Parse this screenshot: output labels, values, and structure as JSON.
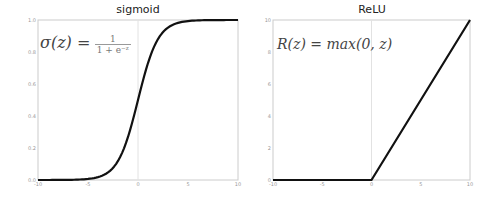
{
  "chart_data": [
    {
      "type": "line",
      "title": "sigmoid",
      "formula": "σ(z) = 1 / (1 + e^-z)",
      "formula_parts": {
        "lhs": "σ(z) =",
        "num": "1",
        "den": "1 + e⁻ᶻ"
      },
      "xlabel": "",
      "ylabel": "",
      "xlim": [
        -10,
        10
      ],
      "ylim": [
        0.0,
        1.0
      ],
      "xticks": [
        "-10",
        "-5",
        "0",
        "5",
        "10"
      ],
      "yticks": [
        "0.0",
        "0.2",
        "0.4",
        "0.6",
        "0.8",
        "1.0"
      ],
      "grid": "x=0 vertical gridline only",
      "x": [
        -10,
        -8,
        -6,
        -5,
        -4,
        -3,
        -2,
        -1,
        0,
        1,
        2,
        3,
        4,
        5,
        6,
        8,
        10
      ],
      "values": [
        0.0,
        0.0003,
        0.0025,
        0.0067,
        0.018,
        0.047,
        0.119,
        0.269,
        0.5,
        0.731,
        0.881,
        0.953,
        0.982,
        0.993,
        0.9975,
        0.9997,
        1.0
      ],
      "line_color": "#111111"
    },
    {
      "type": "line",
      "title": "ReLU",
      "formula": "R(z) = max(0, z)",
      "xlabel": "",
      "ylabel": "",
      "xlim": [
        -10,
        10
      ],
      "ylim": [
        0,
        10
      ],
      "xticks": [
        "-10",
        "-5",
        "0",
        "5",
        "10"
      ],
      "yticks": [
        "0",
        "2",
        "4",
        "6",
        "8",
        "10"
      ],
      "grid": "x=0 vertical gridline only",
      "x": [
        -10,
        0,
        10
      ],
      "values": [
        0,
        0,
        10
      ],
      "line_color": "#111111"
    }
  ]
}
